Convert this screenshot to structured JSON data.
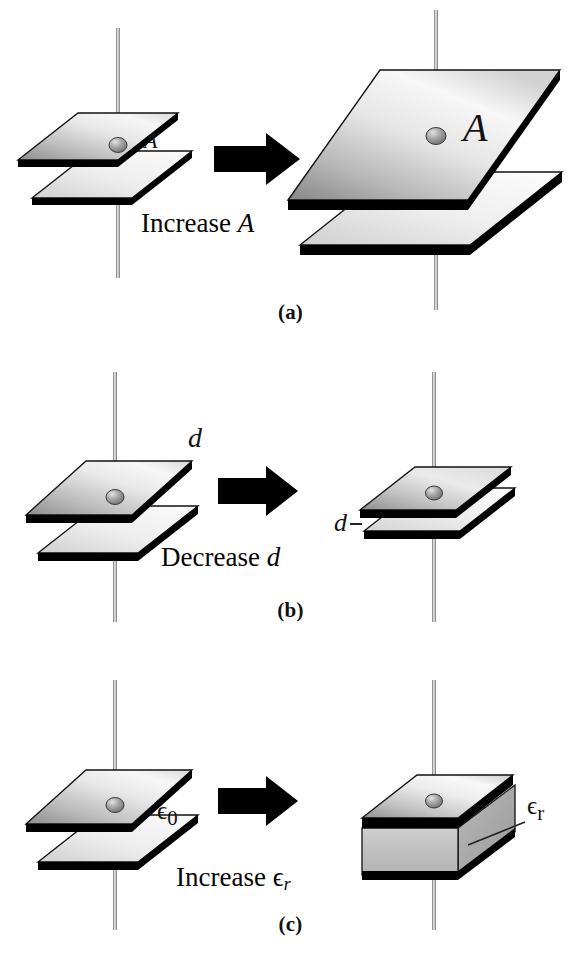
{
  "figure": {
    "background_color": "#ffffff",
    "plate_fill_light": "#f2f2f2",
    "plate_fill_dark": "#8e8e8e",
    "edge_color": "#000000",
    "wire_color": "#8a8a8a",
    "knob_color": "#9a9a9a"
  },
  "panels": [
    {
      "id": "a",
      "caption": "(a)",
      "action_text_prefix": "Increase ",
      "action_symbol": "A",
      "left_capacitor": {
        "name": "small-area-capacitor",
        "plate_label": "A",
        "relative_area": 1
      },
      "right_capacitor": {
        "name": "large-area-capacitor",
        "plate_label": "A",
        "relative_area": 4
      },
      "arrow": "right-arrow"
    },
    {
      "id": "b",
      "caption": "(b)",
      "action_text_prefix": "Decrease ",
      "action_symbol": "d",
      "left_capacitor": {
        "name": "wide-gap-capacitor",
        "gap_label": "d",
        "relative_gap": 1
      },
      "right_capacitor": {
        "name": "narrow-gap-capacitor",
        "gap_label": "d",
        "relative_gap": 0.3
      },
      "arrow": "right-arrow"
    },
    {
      "id": "c",
      "caption": "(c)",
      "action_text_prefix": "Increase ",
      "action_symbol": "ϵ",
      "action_symbol_sub": "r",
      "left_capacitor": {
        "name": "vacuum-capacitor",
        "dielectric_label": "ϵ",
        "dielectric_label_sub": "0"
      },
      "right_capacitor": {
        "name": "dielectric-filled-capacitor",
        "dielectric_label": "ϵ",
        "dielectric_label_sub": "r"
      },
      "arrow": "right-arrow"
    }
  ]
}
